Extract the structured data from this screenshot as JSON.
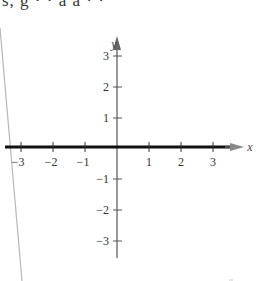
{
  "header": {
    "clipped_text": "s, g  · · a a  · ·"
  },
  "graph": {
    "x_axis_label": "x",
    "y_axis_label": "y",
    "x_ticks": [
      {
        "value": -3,
        "label": "−3"
      },
      {
        "value": -2,
        "label": "−2"
      },
      {
        "value": -1,
        "label": "−1"
      },
      {
        "value": 1,
        "label": "1"
      },
      {
        "value": 2,
        "label": "2"
      },
      {
        "value": 3,
        "label": "3"
      }
    ],
    "y_ticks": [
      {
        "value": 3,
        "label": "3"
      },
      {
        "value": 2,
        "label": "2"
      },
      {
        "value": 1,
        "label": "1"
      },
      {
        "value": -1,
        "label": "−1"
      },
      {
        "value": -2,
        "label": "−2"
      },
      {
        "value": -3,
        "label": "−3"
      }
    ],
    "x_range": [
      -3,
      3
    ],
    "y_range": [
      -3,
      3
    ],
    "highlighted_axis": "x",
    "colors": {
      "axis": "#555555",
      "highlight": "#111111",
      "arrow": "#777777",
      "page_edge": "#b0b0b0"
    }
  }
}
